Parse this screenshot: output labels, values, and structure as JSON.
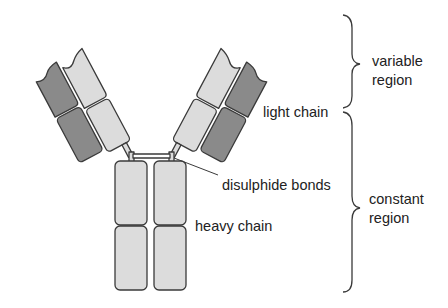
{
  "diagram": {
    "colors": {
      "light_domain": "#dcdcdc",
      "dark_domain": "#8a8a8a",
      "outline": "#3a3a3a",
      "background": "#ffffff"
    },
    "labels": {
      "light_chain": "light chain",
      "disulphide_bonds": "disulphide bonds",
      "heavy_chain": "heavy chain",
      "variable_region_line1": "variable",
      "variable_region_line2": "region",
      "constant_region_line1": "constant",
      "constant_region_line2": "region"
    },
    "brackets": [
      {
        "name": "variable region",
        "y_top": 15,
        "y_bottom": 108
      },
      {
        "name": "constant region",
        "y_top": 112,
        "y_bottom": 292
      }
    ]
  }
}
